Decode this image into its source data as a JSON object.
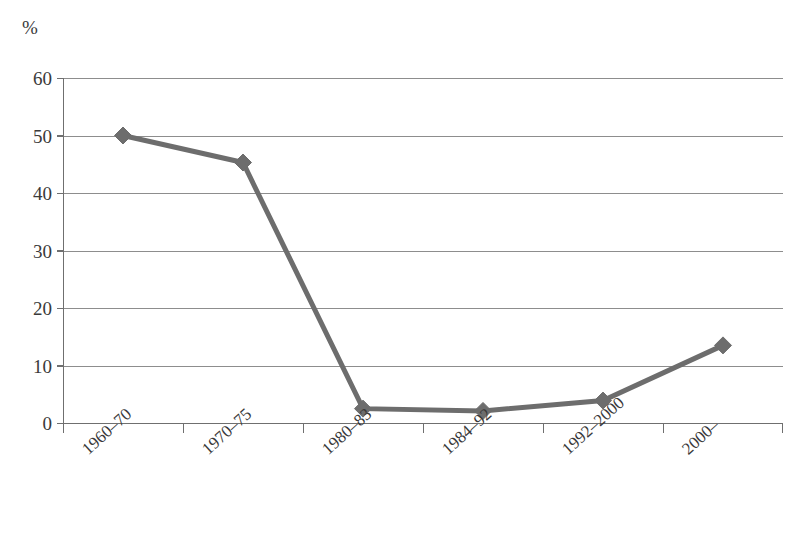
{
  "chart_data": {
    "type": "line",
    "title": "",
    "xlabel": "",
    "ylabel": "%",
    "unit_label": "%",
    "categories": [
      "1960–70",
      "1970–75",
      "1980–83",
      "1984–92",
      "1992–2000",
      "2000–"
    ],
    "values": [
      50.0,
      45.3,
      2.5,
      2.1,
      3.9,
      13.5
    ],
    "series": [
      {
        "name": "",
        "values": [
          50.0,
          45.3,
          2.5,
          2.1,
          3.9,
          13.5
        ]
      }
    ],
    "ylim": [
      0,
      60
    ],
    "ytick_values": [
      0,
      10,
      20,
      30,
      40,
      50,
      60
    ],
    "ytick_labels": [
      "0",
      "10",
      "20",
      "30",
      "40",
      "50",
      "60"
    ],
    "ytick_step": 10,
    "grid": "horizontal",
    "legend": "none",
    "marker": "diamond",
    "line_color": "#6d6d6d",
    "marker_color": "#6d6d6d",
    "gridline_color": "#8d8d8d",
    "axis_color": "#6f6f6f",
    "background_color": "#ffffff",
    "text_color": "#3a3a3a",
    "xtick_label_rotation": -42
  }
}
